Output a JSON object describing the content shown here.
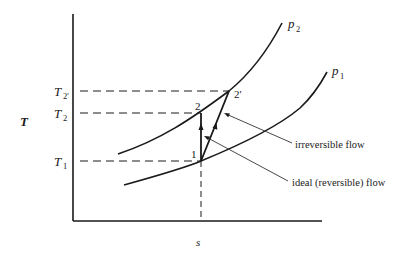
{
  "diagram": {
    "type": "T-s diagram (compression process)",
    "axes": {
      "y_label": "T",
      "x_label": "s"
    },
    "temperature_levels": [
      {
        "label": "T",
        "sub": "2'",
        "id": "T2prime"
      },
      {
        "label": "T",
        "sub": "2",
        "id": "T2"
      },
      {
        "label": "T",
        "sub": "1",
        "id": "T1"
      }
    ],
    "isobars": [
      {
        "label": "p",
        "sub": "2"
      },
      {
        "label": "p",
        "sub": "1"
      }
    ],
    "points": [
      {
        "label": "1"
      },
      {
        "label": "2"
      },
      {
        "label": "2'"
      }
    ],
    "annotations": {
      "irreversible": "irreversible flow",
      "ideal": "ideal (reversible) flow"
    },
    "colors": {
      "line": "#1a1a1a",
      "background": "#ffffff"
    }
  }
}
